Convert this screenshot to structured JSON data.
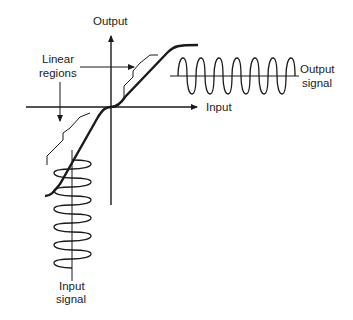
{
  "diagram": {
    "type": "transfer-characteristic",
    "labels": {
      "y_axis": "Output",
      "x_axis": "Input",
      "linear_regions_line1": "Linear",
      "linear_regions_line2": "regions",
      "output_signal_line1": "Output",
      "output_signal_line2": "signal",
      "input_signal_line1": "Input",
      "input_signal_line2": "signal"
    },
    "colors": {
      "stroke": "#1a1a1a",
      "text": "#222222",
      "background": "#ffffff"
    },
    "output_signal_cycles": 7,
    "input_signal_cycles": 8
  }
}
